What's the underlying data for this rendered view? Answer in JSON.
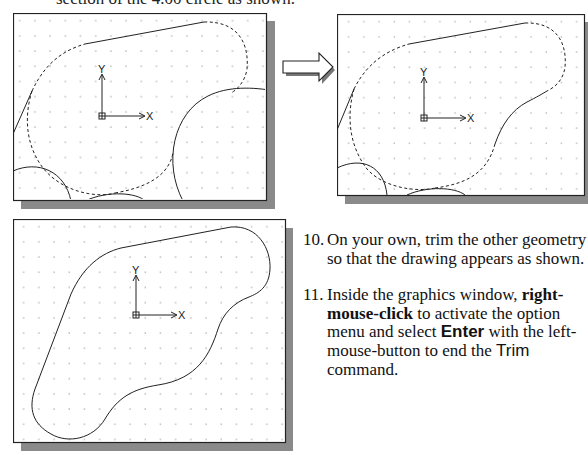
{
  "top_text": "section of the 4.00 circle as shown.",
  "panels": [
    {
      "name": "before-trim",
      "ucs": {
        "x_label": "X",
        "y_label": "Y"
      }
    },
    {
      "name": "after-first-trim",
      "ucs": {
        "x_label": "X",
        "y_label": "Y"
      }
    },
    {
      "name": "final-trimmed-outline",
      "ucs": {
        "x_label": "X",
        "y_label": "Y"
      }
    }
  ],
  "transition_arrow": "right-arrow-icon",
  "steps": [
    {
      "number": "10.",
      "text": "On your own, trim the other geometry so that the drawing appears as shown."
    },
    {
      "number": "11.",
      "t1": "Inside the graphics window, ",
      "b1": "right-mouse-click",
      "t2": " to activate the option menu and select ",
      "b2": "Enter",
      "t3": " with the left-mouse-button to end the ",
      "b3": "Trim",
      "t4": " command."
    }
  ],
  "colors": {
    "frame": "#222222",
    "shadow": "#8a8a8a",
    "grid_dot": "#b5b5b5",
    "line": "#222222"
  }
}
